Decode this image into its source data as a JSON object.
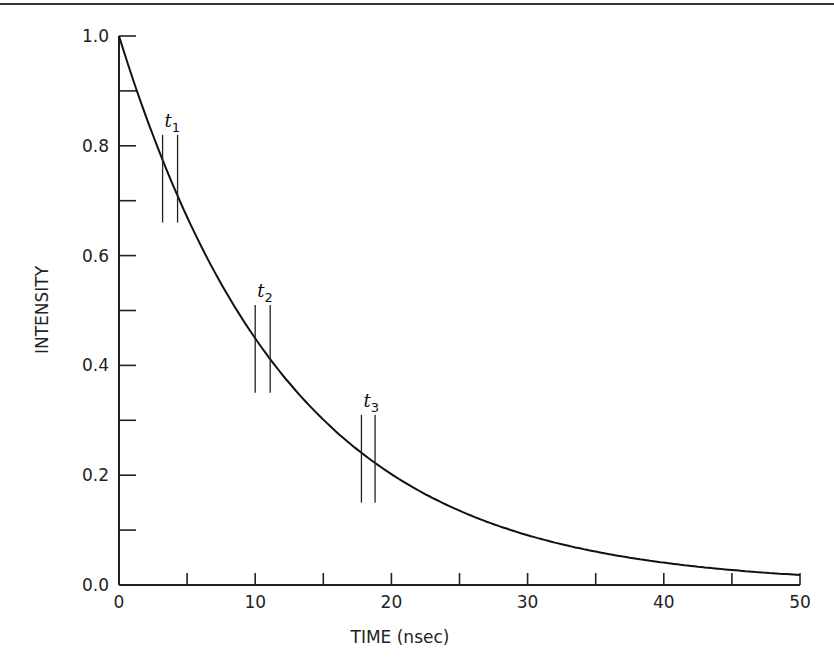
{
  "chart_data": {
    "type": "line",
    "title": "",
    "xlabel": "TIME (nsec)",
    "ylabel": "INTENSITY",
    "xlim": [
      0,
      50
    ],
    "ylim": [
      0.0,
      1.0
    ],
    "x_ticks": [
      0,
      10,
      20,
      30,
      40,
      50
    ],
    "x_minor_ticks": [
      5,
      15,
      25,
      35,
      45
    ],
    "y_ticks": [
      "0.0",
      "0.2",
      "0.4",
      "0.6",
      "0.8",
      "1.0"
    ],
    "y_minor_ticks": [
      0.1,
      0.3,
      0.5,
      0.7,
      0.9
    ],
    "grid": false,
    "legend": null,
    "series": [
      {
        "name": "exponential decay",
        "function": "I(t) = exp(-t / 12.5)",
        "x": [
          0,
          2.5,
          5,
          7.5,
          10,
          12.5,
          15,
          17.5,
          20,
          25,
          30,
          35,
          40,
          45,
          50
        ],
        "y": [
          1.0,
          0.82,
          0.67,
          0.55,
          0.45,
          0.37,
          0.3,
          0.25,
          0.2,
          0.135,
          0.09,
          0.06,
          0.04,
          0.027,
          0.018
        ]
      }
    ],
    "annotations": [
      {
        "label": "t",
        "sub": "1",
        "x_start": 3.2,
        "x_end": 4.3,
        "y_low": 0.66,
        "y_high": 0.82
      },
      {
        "label": "t",
        "sub": "2",
        "x_start": 10.0,
        "x_end": 11.1,
        "y_low": 0.35,
        "y_high": 0.51
      },
      {
        "label": "t",
        "sub": "3",
        "x_start": 17.8,
        "x_end": 18.8,
        "y_low": 0.15,
        "y_high": 0.31
      }
    ]
  },
  "labels": {
    "x_title": "TIME (nsec)",
    "y_title": "INTENSITY",
    "x_ticks": [
      "0",
      "10",
      "20",
      "30",
      "40",
      "50"
    ],
    "y_ticks": [
      "0.0",
      "0.2",
      "0.4",
      "0.6",
      "0.8",
      "1.0"
    ],
    "markers": [
      {
        "t": "t",
        "sub": "1"
      },
      {
        "t": "t",
        "sub": "2"
      },
      {
        "t": "t",
        "sub": "3"
      }
    ]
  }
}
